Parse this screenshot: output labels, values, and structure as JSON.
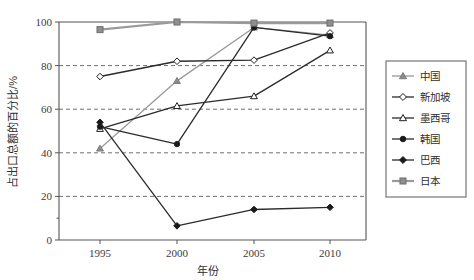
{
  "chart_data": {
    "type": "line",
    "title": "",
    "xlabel": "年份",
    "ylabel": "占出口总额的百分比/%",
    "x": [
      1995,
      2000,
      2005,
      2010
    ],
    "xtick_labels": [
      "1995",
      "2000",
      "2005",
      "2010"
    ],
    "ytick_labels": [
      "0",
      "20",
      "40",
      "60",
      "80",
      "100"
    ],
    "yticks": [
      0,
      20,
      40,
      60,
      80,
      100
    ],
    "ylim": [
      0,
      100
    ],
    "xlim": [
      1993.5,
      2011.5
    ],
    "grid": "horizontal-dashed",
    "legend_position": "right-outside",
    "series": [
      {
        "name": "中国",
        "marker": "triangle-filled",
        "color": "#8c8c8c",
        "line_color": "#9a9a9a",
        "values": [
          42,
          73,
          97.5,
          94
        ]
      },
      {
        "name": "新加坡",
        "marker": "diamond-open",
        "color": "#ffffff",
        "line_color": "#2b2b2b",
        "values": [
          75,
          82,
          82.5,
          95
        ]
      },
      {
        "name": "墨西哥",
        "marker": "triangle-open",
        "color": "#ffffff",
        "line_color": "#2b2b2b",
        "values": [
          51,
          61.5,
          66,
          87
        ]
      },
      {
        "name": "韩国",
        "marker": "circle-filled",
        "color": "#1a1a1a",
        "line_color": "#2b2b2b",
        "values": [
          52,
          44,
          97.5,
          93.5
        ]
      },
      {
        "name": "巴西",
        "marker": "diamond-filled",
        "color": "#1a1a1a",
        "line_color": "#2b2b2b",
        "values": [
          54,
          6.5,
          14,
          15
        ]
      },
      {
        "name": "日本",
        "marker": "square-filled",
        "color": "#8f8f8f",
        "line_color": "#9a9a9a",
        "values": [
          96.5,
          100,
          99.5,
          99.5
        ]
      }
    ]
  }
}
